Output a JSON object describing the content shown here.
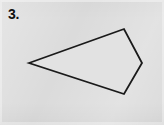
{
  "figure": {
    "problem_number": "3.",
    "background_color": "#dbdbdb",
    "stroke_color": "#1a1a1a",
    "fill_color": "#e2e2e2",
    "stroke_width": 1.8,
    "width": 164,
    "height": 125
  },
  "chart_data": {
    "type": "scatter",
    "title": "3.",
    "subtitle": "Quadrilateral (kite) figure",
    "xlabel": "",
    "ylabel": "",
    "xlim": [
      0,
      164
    ],
    "ylim": [
      0,
      125
    ],
    "grid": false,
    "legend_position": "none",
    "annotations": [
      {
        "text": "3.",
        "x": 8,
        "y": 7
      }
    ],
    "series": [
      {
        "name": "quadrilateral-outline",
        "closed": true,
        "x": [
          29,
          124,
          142,
          124
        ],
        "y": [
          63,
          29,
          63,
          94
        ],
        "vertices": [
          {
            "label": "left-point",
            "x": 29,
            "y": 63
          },
          {
            "label": "top-point",
            "x": 124,
            "y": 29
          },
          {
            "label": "right-point",
            "x": 142,
            "y": 63
          },
          {
            "label": "bottom-point",
            "x": 124,
            "y": 94
          }
        ],
        "edges": [
          {
            "from": "left-point",
            "to": "top-point"
          },
          {
            "from": "top-point",
            "to": "right-point"
          },
          {
            "from": "right-point",
            "to": "bottom-point"
          },
          {
            "from": "bottom-point",
            "to": "left-point"
          }
        ]
      }
    ]
  }
}
